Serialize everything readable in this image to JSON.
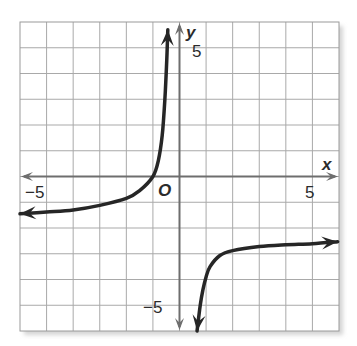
{
  "chart_data": {
    "type": "line",
    "title": "",
    "xlabel": "x",
    "ylabel": "y",
    "origin_label": "O",
    "xlim": [
      -6,
      6
    ],
    "ylim": [
      -6,
      6
    ],
    "grid": true,
    "grid_step": 1,
    "tick_labels": {
      "x": [
        {
          "value": -5,
          "label": "−5"
        },
        {
          "value": 5,
          "label": "5"
        }
      ],
      "y": [
        {
          "value": 5,
          "label": "5"
        },
        {
          "value": -5,
          "label": "−5"
        }
      ]
    },
    "asymptotes": {
      "vertical_x_approx": 0.3,
      "horizontal_y_approx": -2
    },
    "series": [
      {
        "name": "left branch",
        "description": "rises from left arrow near y≈-1.5 through (-1,0) up toward vertical asymptote, arrow at top",
        "points": [
          [
            -6,
            -1.45
          ],
          [
            -5,
            -1.38
          ],
          [
            -4,
            -1.3
          ],
          [
            -3,
            -1.12
          ],
          [
            -2,
            -0.85
          ],
          [
            -1.5,
            -0.55
          ],
          [
            -1,
            0
          ],
          [
            -0.8,
            0.6
          ],
          [
            -0.65,
            1.6
          ],
          [
            -0.55,
            3.0
          ],
          [
            -0.48,
            4.5
          ],
          [
            -0.44,
            5.7
          ]
        ],
        "arrows": [
          "start",
          "end"
        ]
      },
      {
        "name": "right branch",
        "description": "comes up from bottom arrow near x≈0.66 and levels off approaching y≈-2.5, arrow at right",
        "points": [
          [
            0.66,
            -6.0
          ],
          [
            0.78,
            -5.0
          ],
          [
            0.88,
            -4.4
          ],
          [
            1.0,
            -3.9
          ],
          [
            1.15,
            -3.5
          ],
          [
            1.52,
            -3.07
          ],
          [
            2.0,
            -2.88
          ],
          [
            3.0,
            -2.72
          ],
          [
            4.0,
            -2.65
          ],
          [
            5.0,
            -2.61
          ],
          [
            5.95,
            -2.53
          ]
        ],
        "arrows": [
          "start",
          "end"
        ]
      }
    ],
    "colors": {
      "grid": "#a9a9a9",
      "axes": "#6e6e6e",
      "curve": "#262626",
      "border": "#9a9a9a",
      "shadow": "#d9d9d9"
    }
  }
}
